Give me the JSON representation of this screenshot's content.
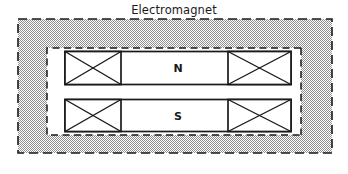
{
  "figure": {
    "title": "Electromagnet",
    "labels": {
      "north_pole": "N",
      "south_pole": "S"
    },
    "colors": {
      "yoke_fill": "#b8b8b8",
      "line": "#1a1a1a",
      "core_fill": "#ffffff",
      "background": "#ffffff"
    },
    "parts": {
      "outer_yoke_name": "Electromagnet yoke (dashed outline, hatched fill)",
      "coil_symbol": "X",
      "coil_count": "4"
    }
  }
}
